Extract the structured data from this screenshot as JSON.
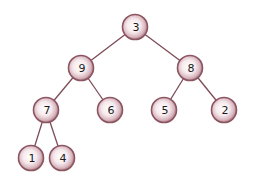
{
  "diagram": {
    "type": "binary-tree",
    "colors": {
      "edge": "#7d4a55",
      "node_rim": "#8c5562",
      "node_mid": "#d9b7bf",
      "node_highlight": "#ffffff",
      "label": "#1a1a1a",
      "background": "#ffffff"
    },
    "nodes": [
      {
        "id": "n3",
        "label": "3",
        "x": 135,
        "y": 27
      },
      {
        "id": "n9",
        "label": "9",
        "x": 81,
        "y": 68
      },
      {
        "id": "n8",
        "label": "8",
        "x": 190,
        "y": 68
      },
      {
        "id": "n7",
        "label": "7",
        "x": 46,
        "y": 110
      },
      {
        "id": "n6",
        "label": "6",
        "x": 110,
        "y": 110
      },
      {
        "id": "n5",
        "label": "5",
        "x": 164,
        "y": 110
      },
      {
        "id": "n2",
        "label": "2",
        "x": 224,
        "y": 110
      },
      {
        "id": "n1",
        "label": "1",
        "x": 31,
        "y": 158
      },
      {
        "id": "n4",
        "label": "4",
        "x": 62,
        "y": 158
      }
    ],
    "edges": [
      [
        "n3",
        "n9"
      ],
      [
        "n3",
        "n8"
      ],
      [
        "n9",
        "n7"
      ],
      [
        "n9",
        "n6"
      ],
      [
        "n8",
        "n5"
      ],
      [
        "n8",
        "n2"
      ],
      [
        "n7",
        "n1"
      ],
      [
        "n7",
        "n4"
      ]
    ]
  }
}
